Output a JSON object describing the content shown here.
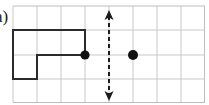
{
  "figure": {
    "part_label": "a)",
    "caption": "",
    "background_color": "#ffffff",
    "grid": {
      "line_color": "#c8c8c8",
      "border_color": "#bdbdbd",
      "line_width": 1,
      "columns": 8,
      "rows": 4,
      "cell_size": 24,
      "origin_x": 13,
      "origin_y": 6,
      "x_lines": [
        13,
        37,
        61,
        85,
        109,
        133,
        157,
        181,
        205
      ],
      "y_lines": [
        6,
        30,
        55,
        79,
        103
      ]
    },
    "shape": {
      "name": "L-shape polygon",
      "stroke_color": "#2b2b2b",
      "stroke_width": 2,
      "fill": "none",
      "points": "13,30 85,30 85,55 37,55 37,79 13,79"
    },
    "mirror_line": {
      "name": "line of reflection",
      "orientation": "vertical",
      "stroke_color": "#1b1b1b",
      "stroke_width": 2,
      "dash_pattern": "4,3",
      "x": 109,
      "y_top": 14,
      "y_bottom": 97,
      "arrow_top": true,
      "arrow_bottom": true
    },
    "points": [
      {
        "name": "pre-image-point",
        "x": 85,
        "y": 55,
        "radius": 4.5,
        "color": "#111111",
        "label": ""
      },
      {
        "name": "image-point",
        "x": 133,
        "y": 55,
        "radius": 5,
        "color": "#111111",
        "label": ""
      }
    ]
  }
}
